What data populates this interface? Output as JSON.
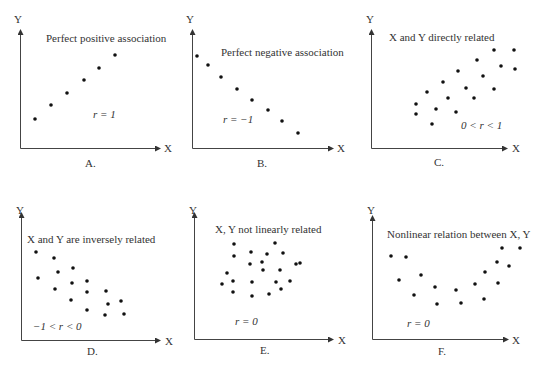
{
  "panels": [
    {
      "id": "A",
      "label": "A.",
      "title": "Perfect positive association",
      "r_text": "r = 1",
      "x_axis": "X",
      "y_axis": "Y",
      "points": [
        [
          35,
          119
        ],
        [
          51,
          105
        ],
        [
          67,
          93
        ],
        [
          84,
          80
        ],
        [
          99,
          68
        ],
        [
          115,
          55
        ]
      ]
    },
    {
      "id": "B",
      "label": "B.",
      "title": "Perfect negative association",
      "r_text": "r = −1",
      "x_axis": "X",
      "y_axis": "Y",
      "points": [
        [
          197,
          56
        ],
        [
          208,
          65
        ],
        [
          221,
          77
        ],
        [
          237,
          89
        ],
        [
          252,
          100
        ],
        [
          268,
          110
        ],
        [
          282,
          121
        ],
        [
          298,
          133
        ]
      ]
    },
    {
      "id": "C",
      "label": "C.",
      "title": "X and Y directly related",
      "r_text": "0 < r < 1",
      "x_axis": "X",
      "y_axis": "Y",
      "points": [
        [
          416,
          104
        ],
        [
          416,
          114
        ],
        [
          427,
          92
        ],
        [
          432,
          124
        ],
        [
          436,
          109
        ],
        [
          443,
          82
        ],
        [
          448,
          98
        ],
        [
          456,
          112
        ],
        [
          458,
          71
        ],
        [
          466,
          88
        ],
        [
          474,
          98
        ],
        [
          477,
          60
        ],
        [
          483,
          76
        ],
        [
          494,
          89
        ],
        [
          494,
          50
        ],
        [
          501,
          66
        ],
        [
          514,
          50
        ],
        [
          515,
          69
        ]
      ]
    },
    {
      "id": "D",
      "label": "D.",
      "title": "X and Y are inversely related",
      "r_text": "−1 < r < 0",
      "x_axis": "X",
      "y_axis": "Y",
      "points": [
        [
          36,
          252
        ],
        [
          38,
          278
        ],
        [
          54,
          258
        ],
        [
          58,
          272
        ],
        [
          55,
          289
        ],
        [
          73,
          268
        ],
        [
          72,
          283
        ],
        [
          71,
          300
        ],
        [
          87,
          281
        ],
        [
          87,
          292
        ],
        [
          87,
          310
        ],
        [
          106,
          291
        ],
        [
          108,
          304
        ],
        [
          105,
          315
        ],
        [
          121,
          301
        ],
        [
          124,
          314
        ]
      ]
    },
    {
      "id": "E",
      "label": "E.",
      "title": "X, Y not linearly related",
      "r_text": "r = 0",
      "x_axis": "X",
      "y_axis": "Y",
      "points": [
        [
          234,
          244
        ],
        [
          275,
          243
        ],
        [
          234,
          256
        ],
        [
          251,
          252
        ],
        [
          267,
          254
        ],
        [
          283,
          253
        ],
        [
          250,
          264
        ],
        [
          262,
          262
        ],
        [
          296,
          264
        ],
        [
          227,
          273
        ],
        [
          263,
          270
        ],
        [
          280,
          270
        ],
        [
          300,
          263
        ],
        [
          222,
          284
        ],
        [
          233,
          281
        ],
        [
          252,
          282
        ],
        [
          276,
          282
        ],
        [
          290,
          281
        ],
        [
          233,
          292
        ],
        [
          252,
          296
        ],
        [
          269,
          294
        ],
        [
          281,
          289
        ]
      ]
    },
    {
      "id": "F",
      "label": "F.",
      "title": "Nonlinear relation between X, Y",
      "r_text": "r = 0",
      "x_axis": "X",
      "y_axis": "Y",
      "points": [
        [
          391,
          256
        ],
        [
          406,
          257
        ],
        [
          399,
          280
        ],
        [
          414,
          295
        ],
        [
          421,
          275
        ],
        [
          435,
          287
        ],
        [
          437,
          304
        ],
        [
          456,
          290
        ],
        [
          461,
          303
        ],
        [
          475,
          284
        ],
        [
          484,
          299
        ],
        [
          485,
          272
        ],
        [
          497,
          262
        ],
        [
          498,
          283
        ],
        [
          502,
          248
        ],
        [
          509,
          266
        ],
        [
          520,
          248
        ]
      ]
    }
  ],
  "chart_data": [
    {
      "type": "scatter",
      "title": "Perfect positive association",
      "annotation": "r = 1",
      "xlabel": "X",
      "ylabel": "Y",
      "panel_label": "A.",
      "x": [
        1,
        2,
        3,
        4,
        5,
        6
      ],
      "y": [
        1,
        2,
        3,
        4,
        5,
        6
      ]
    },
    {
      "type": "scatter",
      "title": "Perfect negative association",
      "annotation": "r = −1",
      "xlabel": "X",
      "ylabel": "Y",
      "panel_label": "B.",
      "x": [
        1,
        2,
        3,
        4,
        5,
        6,
        7,
        8
      ],
      "y": [
        8,
        7,
        6,
        5,
        4,
        3,
        2,
        1
      ]
    },
    {
      "type": "scatter",
      "title": "X and Y directly related",
      "annotation": "0 < r < 1",
      "xlabel": "X",
      "ylabel": "Y",
      "panel_label": "C.",
      "correlation": "positive, 0 < r < 1",
      "n_points": 18
    },
    {
      "type": "scatter",
      "title": "X and Y are inversely related",
      "annotation": "−1 < r < 0",
      "xlabel": "X",
      "ylabel": "Y",
      "panel_label": "D.",
      "correlation": "negative, −1 < r < 0",
      "n_points": 16
    },
    {
      "type": "scatter",
      "title": "X, Y not linearly related",
      "annotation": "r = 0",
      "xlabel": "X",
      "ylabel": "Y",
      "panel_label": "E.",
      "correlation": "none, r = 0",
      "n_points": 22
    },
    {
      "type": "scatter",
      "title": "Nonlinear relation between X, Y",
      "annotation": "r = 0",
      "xlabel": "X",
      "ylabel": "Y",
      "panel_label": "F.",
      "correlation": "U-shaped nonlinear, r = 0",
      "n_points": 17
    }
  ]
}
